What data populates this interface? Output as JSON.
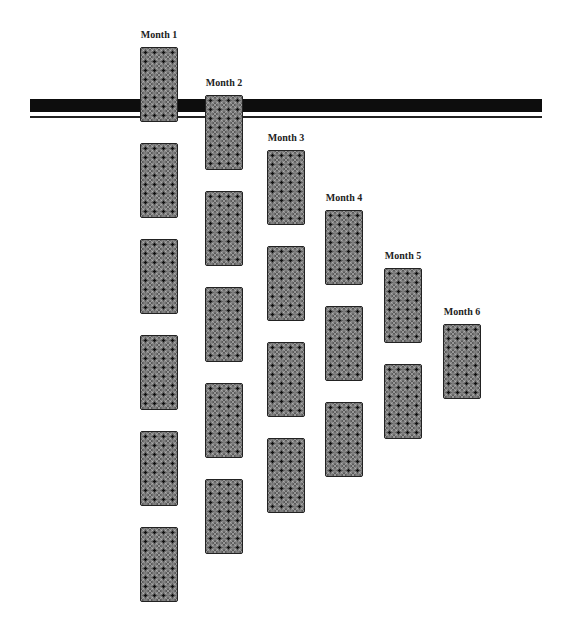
{
  "diagram": {
    "type": "card-spread",
    "columns": [
      {
        "label": "Month 1",
        "card_count": 6
      },
      {
        "label": "Month 2",
        "card_count": 5
      },
      {
        "label": "Month 3",
        "card_count": 4
      },
      {
        "label": "Month 4",
        "card_count": 3
      },
      {
        "label": "Month 5",
        "card_count": 2
      },
      {
        "label": "Month 6",
        "card_count": 1
      }
    ],
    "colors": {
      "bar": "#0d0d0d",
      "card_back": "#5a5a5a",
      "background": "#ffffff"
    }
  }
}
